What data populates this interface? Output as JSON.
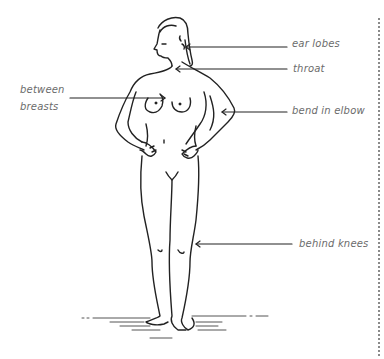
{
  "diagram": {
    "type": "anatomical-figure-with-callouts",
    "line_color": "#222222",
    "label_color": "#6b6b6b",
    "labels": [
      {
        "id": "ear-lobes",
        "text": "ear lobes",
        "side": "right"
      },
      {
        "id": "throat",
        "text": "throat",
        "side": "right"
      },
      {
        "id": "between-breasts",
        "text_line1": "between",
        "text_line2": "breasts",
        "side": "left"
      },
      {
        "id": "bend-in-elbow",
        "text": "bend in elbow",
        "side": "right"
      },
      {
        "id": "behind-knees",
        "text": "behind knees",
        "side": "right"
      }
    ]
  }
}
